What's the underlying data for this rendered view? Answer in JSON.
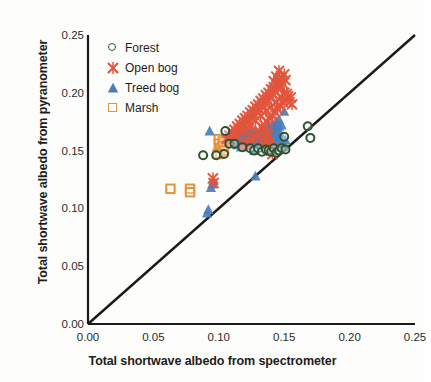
{
  "chart_data": {
    "type": "scatter",
    "title": "",
    "xlabel": "Total shortwave albedo from spectrometer",
    "ylabel": "Total shortwave albedo from pyranometer",
    "xlim": [
      0.0,
      0.25
    ],
    "ylim": [
      0.0,
      0.25
    ],
    "xticks": [
      "0.00",
      "0.05",
      "0.10",
      "0.15",
      "0.20",
      "0.25"
    ],
    "yticks": [
      "0.00",
      "0.05",
      "0.10",
      "0.15",
      "0.20",
      "0.25"
    ],
    "xtick_values": [
      0.0,
      0.05,
      0.1,
      0.15,
      0.2,
      0.25
    ],
    "ytick_values": [
      0.0,
      0.05,
      0.1,
      0.15,
      0.2,
      0.25
    ],
    "grid": false,
    "legend_position": "top-left",
    "reference_line": {
      "name": "one-to-one-line",
      "from": [
        0.0,
        0.0
      ],
      "to": [
        0.25,
        0.25
      ],
      "color": "#1a1a1a"
    },
    "series": [
      {
        "name": "Forest",
        "marker": "circle-open",
        "color": "#2f5233",
        "points": [
          [
            0.088,
            0.146
          ],
          [
            0.098,
            0.146
          ],
          [
            0.104,
            0.147
          ],
          [
            0.105,
            0.167
          ],
          [
            0.108,
            0.156
          ],
          [
            0.112,
            0.156
          ],
          [
            0.118,
            0.153
          ],
          [
            0.124,
            0.152
          ],
          [
            0.127,
            0.15
          ],
          [
            0.13,
            0.152
          ],
          [
            0.133,
            0.149
          ],
          [
            0.136,
            0.151
          ],
          [
            0.138,
            0.15
          ],
          [
            0.14,
            0.149
          ],
          [
            0.142,
            0.152
          ],
          [
            0.144,
            0.148
          ],
          [
            0.146,
            0.15
          ],
          [
            0.148,
            0.152
          ],
          [
            0.15,
            0.162
          ],
          [
            0.151,
            0.151
          ],
          [
            0.168,
            0.171
          ],
          [
            0.17,
            0.161
          ]
        ]
      },
      {
        "name": "Open bog",
        "marker": "x-cross",
        "color": "#e2553c",
        "points": [
          [
            0.0955,
            0.126
          ],
          [
            0.096,
            0.122
          ],
          [
            0.106,
            0.16
          ],
          [
            0.108,
            0.163
          ],
          [
            0.109,
            0.158
          ],
          [
            0.11,
            0.166
          ],
          [
            0.111,
            0.162
          ],
          [
            0.112,
            0.168
          ],
          [
            0.113,
            0.164
          ],
          [
            0.114,
            0.171
          ],
          [
            0.115,
            0.167
          ],
          [
            0.116,
            0.173
          ],
          [
            0.117,
            0.169
          ],
          [
            0.118,
            0.176
          ],
          [
            0.119,
            0.172
          ],
          [
            0.12,
            0.178
          ],
          [
            0.12,
            0.168
          ],
          [
            0.121,
            0.174
          ],
          [
            0.122,
            0.18
          ],
          [
            0.123,
            0.176
          ],
          [
            0.124,
            0.183
          ],
          [
            0.124,
            0.172
          ],
          [
            0.125,
            0.179
          ],
          [
            0.126,
            0.185
          ],
          [
            0.127,
            0.181
          ],
          [
            0.128,
            0.188
          ],
          [
            0.128,
            0.176
          ],
          [
            0.129,
            0.184
          ],
          [
            0.13,
            0.19
          ],
          [
            0.131,
            0.186
          ],
          [
            0.132,
            0.193
          ],
          [
            0.132,
            0.18
          ],
          [
            0.133,
            0.189
          ],
          [
            0.134,
            0.195
          ],
          [
            0.135,
            0.191
          ],
          [
            0.136,
            0.198
          ],
          [
            0.136,
            0.184
          ],
          [
            0.137,
            0.194
          ],
          [
            0.138,
            0.2
          ],
          [
            0.139,
            0.196
          ],
          [
            0.14,
            0.203
          ],
          [
            0.14,
            0.188
          ],
          [
            0.141,
            0.199
          ],
          [
            0.142,
            0.205
          ],
          [
            0.143,
            0.201
          ],
          [
            0.144,
            0.208
          ],
          [
            0.144,
            0.192
          ],
          [
            0.145,
            0.204
          ],
          [
            0.146,
            0.21
          ],
          [
            0.147,
            0.206
          ],
          [
            0.148,
            0.213
          ],
          [
            0.148,
            0.196
          ],
          [
            0.149,
            0.208
          ],
          [
            0.15,
            0.216
          ],
          [
            0.151,
            0.211
          ],
          [
            0.152,
            0.199
          ],
          [
            0.146,
            0.219
          ],
          [
            0.144,
            0.214
          ],
          [
            0.142,
            0.21
          ],
          [
            0.15,
            0.2
          ],
          [
            0.152,
            0.194
          ],
          [
            0.154,
            0.192
          ],
          [
            0.156,
            0.19
          ],
          [
            0.153,
            0.197
          ],
          [
            0.155,
            0.196
          ],
          [
            0.149,
            0.192
          ],
          [
            0.147,
            0.189
          ],
          [
            0.145,
            0.186
          ],
          [
            0.143,
            0.183
          ],
          [
            0.141,
            0.18
          ],
          [
            0.139,
            0.178
          ],
          [
            0.137,
            0.175
          ],
          [
            0.135,
            0.172
          ],
          [
            0.133,
            0.17
          ],
          [
            0.131,
            0.167
          ],
          [
            0.129,
            0.164
          ],
          [
            0.127,
            0.162
          ],
          [
            0.125,
            0.16
          ],
          [
            0.123,
            0.158
          ],
          [
            0.121,
            0.156
          ],
          [
            0.119,
            0.155
          ],
          [
            0.133,
            0.16
          ],
          [
            0.135,
            0.158
          ],
          [
            0.137,
            0.156
          ],
          [
            0.139,
            0.154
          ],
          [
            0.14,
            0.15
          ],
          [
            0.141,
            0.147
          ],
          [
            0.138,
            0.163
          ],
          [
            0.136,
            0.166
          ]
        ]
      },
      {
        "name": "Treed bog",
        "marker": "triangle",
        "color": "#4a7ebb",
        "points": [
          [
            0.091,
            0.096
          ],
          [
            0.092,
            0.099
          ],
          [
            0.094,
            0.118
          ],
          [
            0.095,
            0.121
          ],
          [
            0.096,
            0.124
          ],
          [
            0.093,
            0.167
          ],
          [
            0.112,
            0.158
          ],
          [
            0.113,
            0.162
          ],
          [
            0.114,
            0.155
          ],
          [
            0.115,
            0.165
          ],
          [
            0.116,
            0.159
          ],
          [
            0.117,
            0.153
          ],
          [
            0.118,
            0.163
          ],
          [
            0.119,
            0.157
          ],
          [
            0.12,
            0.167
          ],
          [
            0.121,
            0.161
          ],
          [
            0.122,
            0.155
          ],
          [
            0.123,
            0.165
          ],
          [
            0.124,
            0.159
          ],
          [
            0.125,
            0.169
          ],
          [
            0.126,
            0.163
          ],
          [
            0.127,
            0.157
          ],
          [
            0.128,
            0.167
          ],
          [
            0.129,
            0.161
          ],
          [
            0.13,
            0.155
          ],
          [
            0.131,
            0.165
          ],
          [
            0.132,
            0.159
          ],
          [
            0.133,
            0.169
          ],
          [
            0.134,
            0.163
          ],
          [
            0.135,
            0.157
          ],
          [
            0.136,
            0.167
          ],
          [
            0.137,
            0.161
          ],
          [
            0.138,
            0.171
          ],
          [
            0.139,
            0.165
          ],
          [
            0.14,
            0.159
          ],
          [
            0.141,
            0.169
          ],
          [
            0.142,
            0.163
          ],
          [
            0.143,
            0.157
          ],
          [
            0.144,
            0.167
          ],
          [
            0.145,
            0.161
          ],
          [
            0.146,
            0.171
          ],
          [
            0.147,
            0.165
          ],
          [
            0.148,
            0.159
          ],
          [
            0.149,
            0.155
          ],
          [
            0.15,
            0.153
          ],
          [
            0.151,
            0.159
          ],
          [
            0.128,
            0.128
          ],
          [
            0.127,
            0.15
          ],
          [
            0.144,
            0.175
          ],
          [
            0.146,
            0.177
          ],
          [
            0.148,
            0.172
          ],
          [
            0.15,
            0.184
          ],
          [
            0.143,
            0.17
          ],
          [
            0.141,
            0.173
          ]
        ]
      },
      {
        "name": "Marsh",
        "marker": "square-open",
        "color": "#e8913a",
        "points": [
          [
            0.063,
            0.117
          ],
          [
            0.078,
            0.117
          ],
          [
            0.078,
            0.114
          ],
          [
            0.1,
            0.16
          ],
          [
            0.1,
            0.156
          ],
          [
            0.101,
            0.152
          ],
          [
            0.101,
            0.148
          ],
          [
            0.103,
            0.158
          ],
          [
            0.103,
            0.154
          ],
          [
            0.104,
            0.15
          ],
          [
            0.099,
            0.147
          ]
        ]
      }
    ]
  },
  "legend": {
    "items": [
      {
        "label": "Forest",
        "marker": "circle-open",
        "color": "#2f5233"
      },
      {
        "label": "Open bog",
        "marker": "x-cross",
        "color": "#e2553c"
      },
      {
        "label": "Treed bog",
        "marker": "triangle",
        "color": "#4a7ebb"
      },
      {
        "label": "Marsh",
        "marker": "square-open",
        "color": "#e8913a"
      }
    ]
  }
}
